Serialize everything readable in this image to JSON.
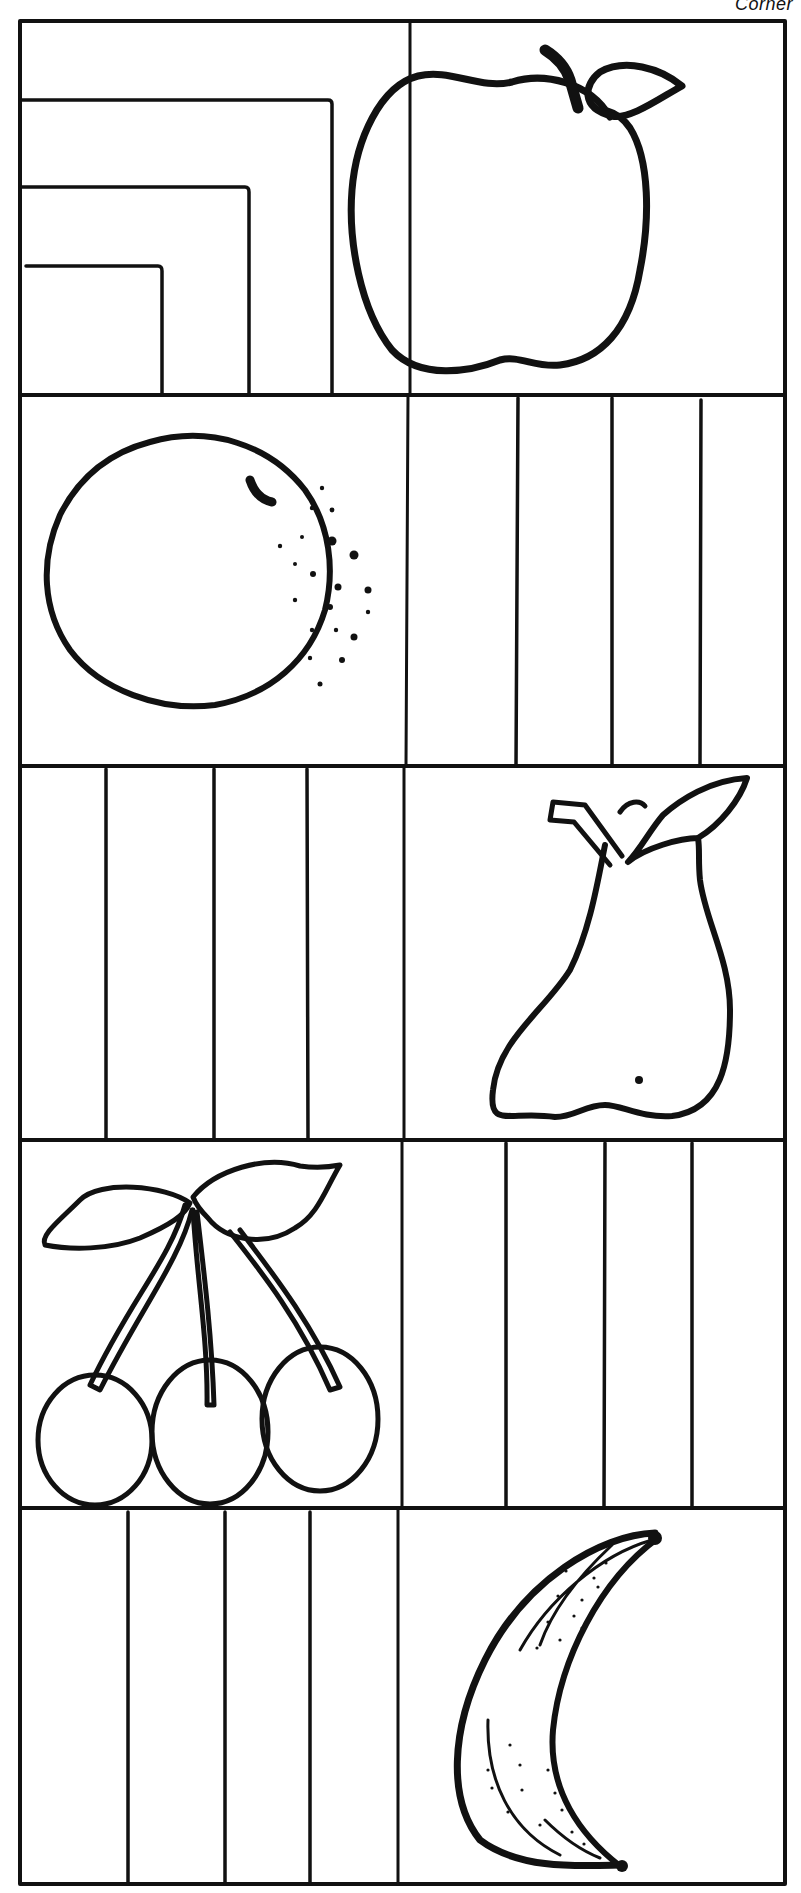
{
  "header": {
    "label": "Corner"
  },
  "worksheet": {
    "rows": 5,
    "columns": 2,
    "line_color": "#111111",
    "background": "#ffffff",
    "cells": [
      {
        "row": 1,
        "col": 1,
        "type": "nested-corner-lines",
        "line_count": 3
      },
      {
        "row": 1,
        "col": 2,
        "type": "fruit",
        "fruit": "apple-icon"
      },
      {
        "row": 2,
        "col": 1,
        "type": "fruit",
        "fruit": "orange-icon"
      },
      {
        "row": 2,
        "col": 2,
        "type": "vertical-stripes",
        "stripe_count": 4
      },
      {
        "row": 3,
        "col": 1,
        "type": "vertical-stripes",
        "stripe_count": 4
      },
      {
        "row": 3,
        "col": 2,
        "type": "fruit",
        "fruit": "pear-icon"
      },
      {
        "row": 4,
        "col": 1,
        "type": "fruit",
        "fruit": "cherries-icon"
      },
      {
        "row": 4,
        "col": 2,
        "type": "vertical-stripes",
        "stripe_count": 4
      },
      {
        "row": 5,
        "col": 1,
        "type": "vertical-stripes",
        "stripe_count": 4
      },
      {
        "row": 5,
        "col": 2,
        "type": "fruit",
        "fruit": "banana-icon"
      }
    ]
  }
}
